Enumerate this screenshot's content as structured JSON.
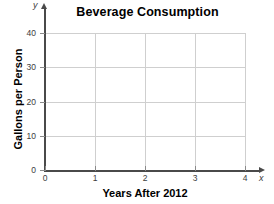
{
  "chart_data": {
    "type": "line",
    "title": "Beverage Consumption",
    "xlabel": "Years After 2012",
    "ylabel": "Gallons per Person",
    "x_axis_symbol": "x",
    "y_axis_symbol": "y",
    "xlim": [
      0,
      4
    ],
    "ylim": [
      0,
      40
    ],
    "x_ticks": [
      "0",
      "1",
      "2",
      "3",
      "4"
    ],
    "x_tick_values": [
      0,
      1,
      2,
      3,
      4
    ],
    "y_ticks": [
      "0",
      "10",
      "20",
      "30",
      "40"
    ],
    "y_tick_values": [
      0,
      10,
      20,
      30,
      40
    ],
    "grid": true,
    "legend": "none",
    "series": [],
    "values": [],
    "categories": [],
    "annotations": [],
    "note": "Empty grid — blank coordinate plane with no plotted data points."
  },
  "style": {
    "grid_color": "#cfcfcf",
    "axis_color": "#4a4a4a",
    "text_color": "#000000",
    "tick_label_color": "#3c3c3c",
    "background": "#ffffff"
  }
}
